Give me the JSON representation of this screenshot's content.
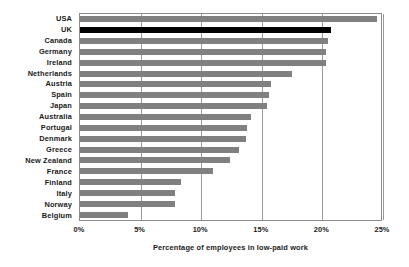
{
  "chart_data": {
    "type": "bar",
    "orientation": "horizontal",
    "title": "",
    "xlabel": "Percentage of employees in low-paid work",
    "ylabel": "",
    "xlim": [
      0,
      25
    ],
    "xticks": [
      0,
      5,
      10,
      15,
      20,
      25
    ],
    "xticklabels": [
      "0%",
      "5%",
      "10%",
      "15%",
      "20%",
      "25%"
    ],
    "grid": true,
    "legend": false,
    "highlight_category": "UK",
    "colors": {
      "bar": "#808080",
      "highlight_bar": "#000000",
      "gridline": "#9a9a9a",
      "frame": "#8c8c8c",
      "text": "#1a1a1a",
      "background": "#ffffff"
    },
    "categories": [
      "USA",
      "UK",
      "Canada",
      "Germany",
      "Ireland",
      "Netherlands",
      "Austria",
      "Spain",
      "Japan",
      "Australia",
      "Portugal",
      "Denmark",
      "Greece",
      "New Zealand",
      "France",
      "Finland",
      "Italy",
      "Norway",
      "Belgium"
    ],
    "values": [
      24.5,
      20.7,
      20.5,
      20.3,
      20.3,
      17.5,
      15.8,
      15.6,
      15.4,
      14.1,
      13.8,
      13.7,
      13.1,
      12.4,
      11.0,
      8.3,
      7.8,
      7.8,
      4.0
    ]
  }
}
